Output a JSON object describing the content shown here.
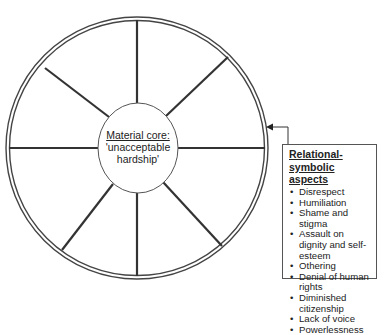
{
  "diagram": {
    "core": {
      "title": "Material core:",
      "line2": "'unacceptable",
      "line3": "hardship'"
    },
    "aspects_box": {
      "heading_line1": "Relational-",
      "heading_line2": "symbolic aspects",
      "items": [
        "Disrespect",
        "Humiliation",
        "Shame and stigma",
        "Assault on dignity and self-esteem",
        "Othering",
        "Denial of human rights",
        "Diminished citizenship",
        "Lack of voice",
        "Powerlessness"
      ]
    },
    "wheel": {
      "spoke_count": 8,
      "ring_style": "double-line",
      "line_color": "#333333"
    },
    "arrow": {
      "from": "aspects_box",
      "to": "outer-ring"
    }
  }
}
